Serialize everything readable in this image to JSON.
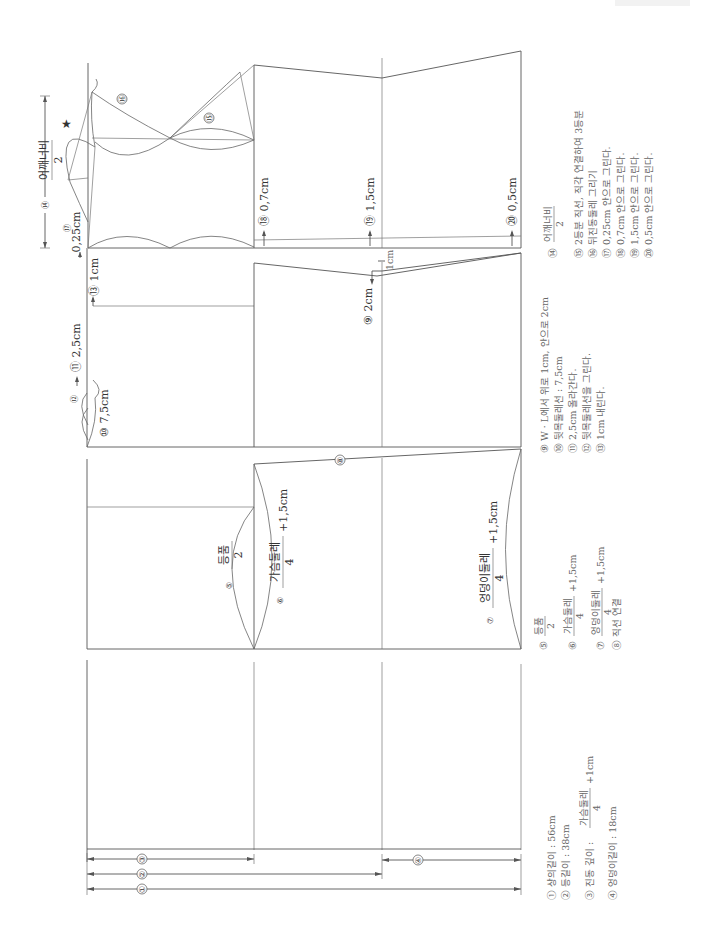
{
  "diagram": {
    "orientation": "rotated-90-ccw",
    "dimension_lines": [
      {
        "id": "1",
        "label": "①",
        "desc": "상의길이"
      },
      {
        "id": "2",
        "label": "②",
        "desc": "등길이"
      },
      {
        "id": "3",
        "label": "③",
        "desc": "진동 깊이"
      },
      {
        "id": "4",
        "label": "④",
        "desc": "엉덩이길이"
      }
    ],
    "labels": {
      "c5_num": "⑤",
      "c5_top": "등품",
      "c5_bot": "2",
      "c6_num": "⑥",
      "c6_top": "가슴둘레",
      "c6_bot": "4",
      "c6_add": "+1,5cm",
      "c7_num": "⑦",
      "c7_top": "엉덩이둘레",
      "c7_bot": "4",
      "c7_add": "+1,5cm",
      "c8_num": "⑧",
      "c9": "⑨ 2cm",
      "c9b": "1cm",
      "c10": "⑩ 7,5cm",
      "c11": "⑪ 2,5cm",
      "c12": "⑫",
      "c13": "⑬ 1cm",
      "c14_num": "⑭",
      "c14_top": "어깨너비",
      "c14_bot": "2",
      "c15": "⑮",
      "c16": "⑯",
      "c17_num": "⑰",
      "c17": "0,25cm",
      "c18": "⑱ 0,7cm",
      "c19": "⑲ 1,5cm",
      "c20": "⑳ 0,5cm",
      "star": "★"
    },
    "notes_group1": [
      "① 상의길이 : 56cm",
      "② 등길이 : 38cm",
      "③ 진동 깊이 : 가슴둘레/4 + 1cm",
      "④ 엉덩이길이 : 18cm"
    ],
    "notes_group2": [
      "⑤ 등품/2",
      "⑥ 가슴둘레/4 +1,5cm",
      "⑦ 엉덩이둘레/4 +1,5cm",
      "⑧ 직선 연결"
    ],
    "notes_group3": [
      "⑨ W · L에서 위로 1cm, 안으로 2cm",
      "⑩ 뒷목둘레선 : 7,5cm",
      "⑪ 2,5cm 올라간다.",
      "⑫ 뒷목둘레선을 그린다.",
      "⑬ 1cm 내린다."
    ],
    "notes_group4": [
      "⑭ 어깨너비/2",
      "⑮ 2등분 직선, 직각 연결하여 3등분",
      "⑯ 뒤진동둘레 그리기",
      "⑰ 0,25cm 안으로 그린다.",
      "⑱ 0,7cm 안으로 그린다.",
      "⑲ 1,5cm 안으로 그린다.",
      "⑳ 0,5cm 안으로 그린다."
    ],
    "n3_frac": {
      "prefix": "③ 진동 깊이 :",
      "top": "가슴둘레",
      "bot": "4",
      "add": "+1cm"
    },
    "n5_frac": {
      "num": "⑤",
      "top": "등품",
      "bot": "2"
    },
    "n6_frac": {
      "num": "⑥",
      "top": "가슴둘레",
      "bot": "4",
      "add": "+1,5cm"
    },
    "n7_frac": {
      "num": "⑦",
      "top": "엉덩이둘레",
      "bot": "4",
      "add": "+1,5cm"
    },
    "n14_frac": {
      "num": "⑭",
      "top": "어깨너비",
      "bot": "2"
    },
    "colors": {
      "line": "#555555",
      "text": "#333333",
      "note": "#666666",
      "bg": "#ffffff"
    }
  }
}
